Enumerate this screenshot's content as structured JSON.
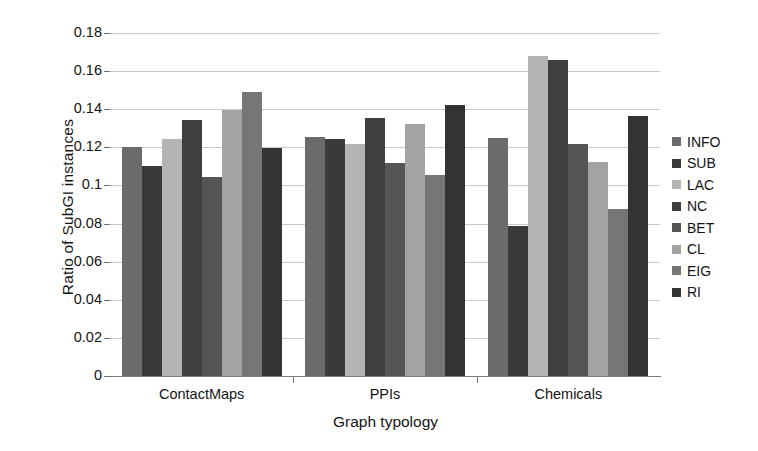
{
  "chart_data": {
    "type": "bar",
    "title": "",
    "xlabel": "Graph typology",
    "ylabel": "Ratio of SubGI instances",
    "categories": [
      "ContactMaps",
      "PPIs",
      "Chemicals"
    ],
    "ylim": [
      0,
      0.18
    ],
    "ytick_labels": [
      "0.18",
      "0.16",
      "0.14",
      "0.12",
      "0.1",
      "0.08",
      "0.06",
      "0.04",
      "0.02",
      "0"
    ],
    "ytick_values": [
      0.18,
      0.16,
      0.14,
      0.12,
      0.1,
      0.08,
      0.06,
      0.04,
      0.02,
      0
    ],
    "grid": "horizontal",
    "legend_position": "right",
    "series": [
      {
        "name": "INFO",
        "color": "#6b6b6b",
        "values": [
          0.12,
          0.1255,
          0.125
        ]
      },
      {
        "name": "SUB",
        "color": "#3a3a3a",
        "values": [
          0.11,
          0.1245,
          0.0785
        ]
      },
      {
        "name": "LAC",
        "color": "#b4b4b4",
        "values": [
          0.1245,
          0.1215,
          0.168
        ]
      },
      {
        "name": "NC",
        "color": "#3f3f3f",
        "values": [
          0.1345,
          0.1355,
          0.166
        ]
      },
      {
        "name": "BET",
        "color": "#555555",
        "values": [
          0.1045,
          0.112,
          0.122
        ]
      },
      {
        "name": "CL",
        "color": "#a3a3a3",
        "values": [
          0.1395,
          0.132,
          0.1125
        ]
      },
      {
        "name": "EIG",
        "color": "#767676",
        "values": [
          0.149,
          0.1055,
          0.0875
        ]
      },
      {
        "name": "RI",
        "color": "#333333",
        "values": [
          0.1195,
          0.142,
          0.1365
        ]
      }
    ]
  },
  "legend": {
    "items": [
      {
        "label": "INFO",
        "color": "#6b6b6b"
      },
      {
        "label": "SUB",
        "color": "#3a3a3a"
      },
      {
        "label": "LAC",
        "color": "#b4b4b4"
      },
      {
        "label": "NC",
        "color": "#3f3f3f"
      },
      {
        "label": "BET",
        "color": "#555555"
      },
      {
        "label": "CL",
        "color": "#a3a3a3"
      },
      {
        "label": "EIG",
        "color": "#767676"
      },
      {
        "label": "RI",
        "color": "#333333"
      }
    ]
  }
}
